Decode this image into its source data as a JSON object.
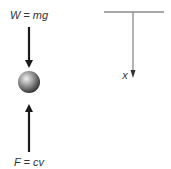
{
  "diagram": {
    "free_body": {
      "weight_label": "W = mg",
      "drag_label": "F = cv",
      "weight_direction": "down",
      "drag_direction": "up",
      "object": "sphere"
    },
    "coordinate_axis": {
      "axis_label": "x",
      "axis_direction": "down",
      "reference": "horizontal support line"
    },
    "colors": {
      "force_arrow": "#1a1a1a",
      "axis_line": "#888888",
      "text": "#333333",
      "sphere_highlight": "#f0f0f0",
      "sphere_shadow": "#2a2a2a"
    }
  }
}
